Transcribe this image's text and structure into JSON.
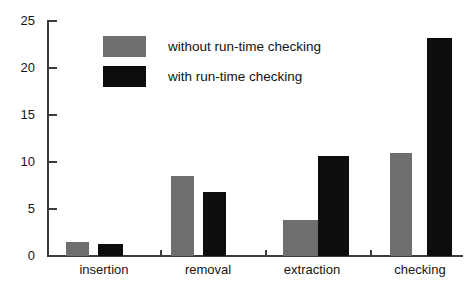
{
  "chart_data": {
    "type": "bar",
    "title": "",
    "xlabel": "",
    "ylabel": "",
    "categories": [
      "insertion",
      "removal",
      "extraction",
      "checking"
    ],
    "series": [
      {
        "name": "without run-time checking",
        "color": "#6e6e6e",
        "values": [
          1.5,
          8.5,
          3.8,
          11.0
        ]
      },
      {
        "name": "with run-time checking",
        "color": "#0d0d0d",
        "values": [
          1.3,
          6.8,
          10.6,
          23.2
        ]
      }
    ],
    "ylim": [
      0,
      25
    ],
    "yticks": [
      0,
      5,
      10,
      15,
      20,
      25
    ],
    "ytick_labels": [
      "0",
      "5",
      "10",
      "15",
      "20",
      "25"
    ],
    "grid": false,
    "legend_position": "upper-center"
  },
  "axes": {
    "y_tick_labels": [
      "25",
      "20",
      "15",
      "10",
      "5",
      "0"
    ],
    "x_tick_labels": [
      "insertion",
      "removal",
      "extraction",
      "checking"
    ]
  },
  "legend": {
    "entries": [
      {
        "label": "without run-time checking",
        "color": "#6e6e6e"
      },
      {
        "label": "with run-time checking",
        "color": "#0d0d0d"
      }
    ]
  },
  "colors": {
    "series_without": "#6e6e6e",
    "series_with": "#0d0d0d",
    "axis": "#3b3b3b",
    "background": "#ffffff",
    "text": "#151515"
  }
}
